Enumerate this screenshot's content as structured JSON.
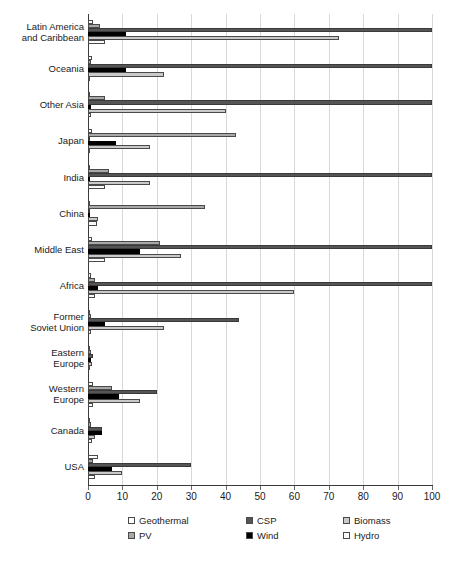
{
  "chart_data": {
    "type": "bar",
    "orientation": "horizontal",
    "title": "",
    "xlabel": "",
    "ylabel": "",
    "xlim": [
      0,
      100
    ],
    "grid": true,
    "legend_position": "bottom",
    "xticks": [
      "0",
      "10",
      "20",
      "30",
      "40",
      "50",
      "60",
      "70",
      "80",
      "90",
      "100"
    ],
    "categories": [
      "Latin America\nand Caribbean",
      "Oceania",
      "Other Asia",
      "Japan",
      "India",
      "China",
      "Middle East",
      "Africa",
      "Former\nSoviet Union",
      "Eastern\nEurope",
      "Western\nEurope",
      "Canada",
      "USA"
    ],
    "series": [
      {
        "name": "Geothermal",
        "color": "#ffffff",
        "values": [
          1.5,
          1.2,
          0.6,
          1.2,
          0.4,
          0.7,
          1.2,
          1.0,
          0.5,
          0.5,
          1.5,
          0.6,
          3.0
        ]
      },
      {
        "name": "PV",
        "color": "#a8a8a8",
        "values": [
          3.5,
          0.8,
          5.0,
          43.0,
          6.0,
          34.0,
          21.0,
          2.0,
          0.8,
          1.0,
          7.0,
          1.0,
          1.5
        ]
      },
      {
        "name": "CSP",
        "color": "#555555",
        "values": [
          100.0,
          100.0,
          100.0,
          0.5,
          100.0,
          0.4,
          100.0,
          100.0,
          44.0,
          1.5,
          20.0,
          4.0,
          30.0
        ]
      },
      {
        "name": "Wind",
        "color": "#000000",
        "values": [
          11.0,
          11.0,
          1.0,
          8.0,
          0.6,
          0.5,
          15.0,
          3.0,
          5.0,
          1.0,
          9.0,
          4.0,
          7.0
        ]
      },
      {
        "name": "Biomass",
        "color": "#c9c9c9",
        "values": [
          73.0,
          22.0,
          40.0,
          18.0,
          18.0,
          3.0,
          27.0,
          60.0,
          22.0,
          1.2,
          15.0,
          2.0,
          10.0
        ]
      },
      {
        "name": "Hydro",
        "color": "#fbfbfb",
        "values": [
          5.0,
          0.6,
          1.0,
          0.7,
          5.0,
          2.5,
          5.0,
          2.0,
          1.0,
          0.6,
          1.5,
          1.2,
          2.0
        ]
      }
    ]
  }
}
